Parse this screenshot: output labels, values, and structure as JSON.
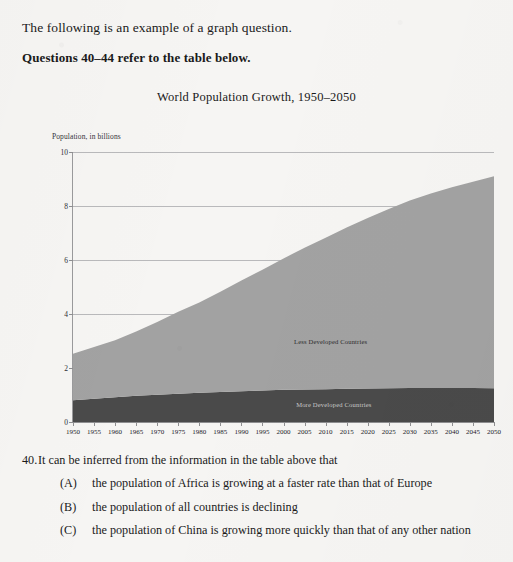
{
  "document": {
    "intro_line": "The following is an example of a graph question.",
    "questions_reference": "Questions 40–44 refer to the table below."
  },
  "chart_data": {
    "type": "area",
    "title": "World Population Growth, 1950–2050",
    "xlabel": "",
    "ylabel": "Population, in billions",
    "ylim": [
      0,
      10
    ],
    "xlim": [
      1950,
      2050
    ],
    "grid": true,
    "stacked": true,
    "legend_position": "inline-labels",
    "y_ticks": [
      0,
      2,
      4,
      6,
      8,
      10
    ],
    "categories": [
      1950,
      1955,
      1960,
      1965,
      1970,
      1975,
      1980,
      1985,
      1990,
      1995,
      2000,
      2005,
      2010,
      2015,
      2020,
      2025,
      2030,
      2035,
      2040,
      2045,
      2050
    ],
    "series": [
      {
        "name": "More Developed Countries",
        "color": "#4a4a4a",
        "values": [
          0.81,
          0.86,
          0.92,
          0.97,
          1.01,
          1.05,
          1.08,
          1.11,
          1.14,
          1.17,
          1.19,
          1.2,
          1.21,
          1.23,
          1.24,
          1.25,
          1.26,
          1.26,
          1.26,
          1.26,
          1.25
        ]
      },
      {
        "name": "Less Developed Countries",
        "color": "#a2a2a2",
        "values": [
          1.72,
          1.92,
          2.11,
          2.38,
          2.69,
          3.03,
          3.35,
          3.71,
          4.1,
          4.47,
          4.87,
          5.25,
          5.61,
          5.97,
          6.32,
          6.64,
          6.94,
          7.2,
          7.43,
          7.64,
          7.85
        ]
      }
    ],
    "totals": [
      2.53,
      2.78,
      3.03,
      3.35,
      3.7,
      4.08,
      4.43,
      4.82,
      5.24,
      5.64,
      6.06,
      6.45,
      6.82,
      7.2,
      7.56,
      7.89,
      8.2,
      8.46,
      8.69,
      8.9,
      9.1
    ]
  },
  "question": {
    "number": "40.",
    "stem": "It can be inferred from the information in the table above that",
    "choices": [
      {
        "letter": "(A)",
        "text": "the population of Africa is growing at a faster rate than that of Europe"
      },
      {
        "letter": "(B)",
        "text": "the population of all countries is declining"
      },
      {
        "letter": "(C)",
        "text": "the population of China is growing more quickly than that of any other nation"
      }
    ]
  }
}
